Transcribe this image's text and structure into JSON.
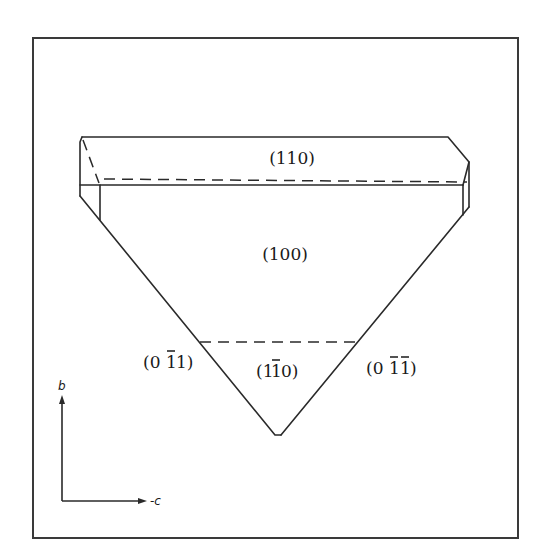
{
  "figure": {
    "type": "crystal-morphology-drawing",
    "faces": [
      {
        "id": "face-110",
        "label": "(110)",
        "text": "(110)"
      },
      {
        "id": "face-100",
        "label": "(100)",
        "text": "(100)"
      },
      {
        "id": "face-1-10",
        "label": "(1̅0)",
        "text": "(1ˉ 0)",
        "parts": [
          "(1",
          "1",
          "0)"
        ],
        "overbar": [
          1
        ]
      },
      {
        "id": "face-0-11",
        "label": "(0̅1)",
        "parts": [
          "(0",
          "1",
          "1)"
        ],
        "overbar": [
          1
        ]
      },
      {
        "id": "face-0-1-1",
        "label": "(0̅1̅)",
        "parts": [
          "(0",
          "1",
          "1",
          ")"
        ],
        "overbar": [
          1,
          2
        ]
      }
    ],
    "axes": {
      "vertical": {
        "label": "b"
      },
      "horizontal": {
        "label": "-c"
      }
    },
    "colors": {
      "line": "#2a2a2a",
      "frame": "#3a3a3a",
      "background": "#ffffff"
    }
  }
}
